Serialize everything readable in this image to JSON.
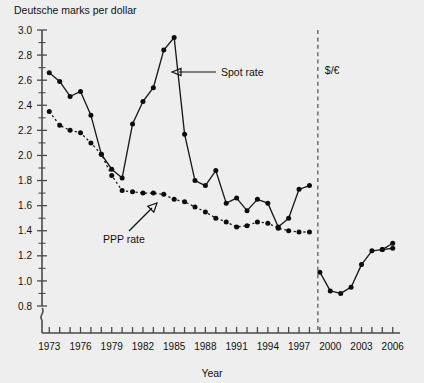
{
  "figure": {
    "ylabel": "Deutsche marks per dollar",
    "xlabel": "Year",
    "background_color": "#eeeeee",
    "line_color": "#1a1a1a"
  },
  "annotations": {
    "spot_label": "Spot rate",
    "ppp_label": "PPP rate",
    "euro_label": "$/€"
  },
  "chart_data": {
    "type": "line",
    "title": "",
    "xlabel": "Year",
    "ylabel": "Deutsche marks per dollar",
    "xlim": [
      1972.3,
      2006.7
    ],
    "ylim": [
      0.8,
      3.0
    ],
    "ytick_step": 0.2,
    "yminor_step": 0.1,
    "xtick_step": 1,
    "xlabel_step": 3,
    "grid": false,
    "legend": "annotations",
    "axis_break": true,
    "yticks": [
      0.8,
      1.0,
      1.2,
      1.4,
      1.6,
      1.8,
      2.0,
      2.2,
      2.4,
      2.6,
      2.8,
      3.0
    ],
    "ytick_labels": [
      "0.8",
      "1.0",
      "1.2",
      "1.4",
      "1.6",
      "1.8",
      "2.0",
      "2.2",
      "2.4",
      "2.6",
      "2.8",
      "3.0"
    ],
    "xticks": [
      1973,
      1974,
      1975,
      1976,
      1977,
      1978,
      1979,
      1980,
      1981,
      1982,
      1983,
      1984,
      1985,
      1986,
      1987,
      1988,
      1989,
      1990,
      1991,
      1992,
      1993,
      1994,
      1995,
      1996,
      1997,
      1998,
      1999,
      2000,
      2001,
      2002,
      2003,
      2004,
      2005,
      2006
    ],
    "xtick_labels": [
      "1973",
      "1976",
      "1979",
      "1982",
      "1985",
      "1988",
      "1991",
      "1994",
      "1997",
      "2000",
      "2003",
      "2006"
    ],
    "euro_transition_year": 1999,
    "series": [
      {
        "name": "Spot rate",
        "style": "solid",
        "x": [
          1973,
          1974,
          1975,
          1976,
          1977,
          1978,
          1979,
          1980,
          1981,
          1982,
          1983,
          1984,
          1985,
          1986,
          1987,
          1988,
          1989,
          1990,
          1991,
          1992,
          1993,
          1994,
          1995,
          1996,
          1997,
          1998
        ],
        "values": [
          2.66,
          2.59,
          2.47,
          2.51,
          2.32,
          2.01,
          1.89,
          1.82,
          2.25,
          2.43,
          2.54,
          2.84,
          2.94,
          2.17,
          1.8,
          1.76,
          1.88,
          1.62,
          1.66,
          1.56,
          1.65,
          1.62,
          1.43,
          1.5,
          1.73,
          1.76
        ]
      },
      {
        "name": "PPP rate",
        "style": "dotted",
        "x": [
          1973,
          1974,
          1975,
          1976,
          1977,
          1978,
          1979,
          1980,
          1981,
          1982,
          1983,
          1984,
          1985,
          1986,
          1987,
          1988,
          1989,
          1990,
          1991,
          1992,
          1993,
          1994,
          1995,
          1996,
          1997,
          1998
        ],
        "values": [
          2.35,
          2.24,
          2.2,
          2.18,
          2.1,
          2.01,
          1.84,
          1.72,
          1.71,
          1.7,
          1.7,
          1.69,
          1.65,
          1.63,
          1.59,
          1.55,
          1.5,
          1.47,
          1.43,
          1.44,
          1.47,
          1.46,
          1.42,
          1.4,
          1.39,
          1.39
        ]
      },
      {
        "name": "$/€ era spot rate",
        "style": "solid",
        "x": [
          1999,
          2000,
          2001,
          2002,
          2003,
          2004,
          2005,
          2006
        ],
        "values": [
          1.07,
          0.92,
          0.9,
          0.95,
          1.13,
          1.24,
          1.25,
          1.26
        ]
      },
      {
        "name": "$/€ era upper",
        "style": "solid",
        "x": [
          2005,
          2006
        ],
        "values": [
          1.25,
          1.3
        ]
      }
    ]
  }
}
